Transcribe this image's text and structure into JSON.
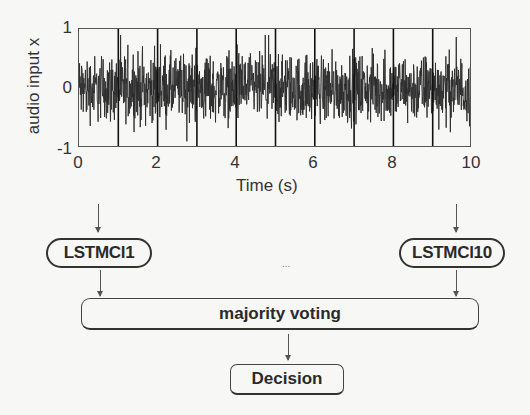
{
  "chart_data": {
    "type": "line",
    "title": "",
    "xlabel": "Time (s)",
    "ylabel": "audio input x",
    "xlim": [
      0,
      10
    ],
    "ylim": [
      -1,
      1
    ],
    "xticks": [
      "0",
      "2",
      "4",
      "6",
      "8",
      "10"
    ],
    "yticks": [
      "1",
      "0",
      "-1"
    ],
    "grid": false,
    "segment_boundaries_s": [
      0,
      1,
      2,
      3,
      4,
      5,
      6,
      7,
      8,
      9,
      10
    ]
  },
  "diagram": {
    "classifier_first": "LSTMCl1",
    "classifier_last": "LSTMCl10",
    "ellipsis": "...",
    "aggregator": "majority voting",
    "output": "Decision"
  },
  "colors": {
    "background": "#f7f7f6",
    "stroke": "#333333",
    "waveform": "#2b2b2b"
  }
}
